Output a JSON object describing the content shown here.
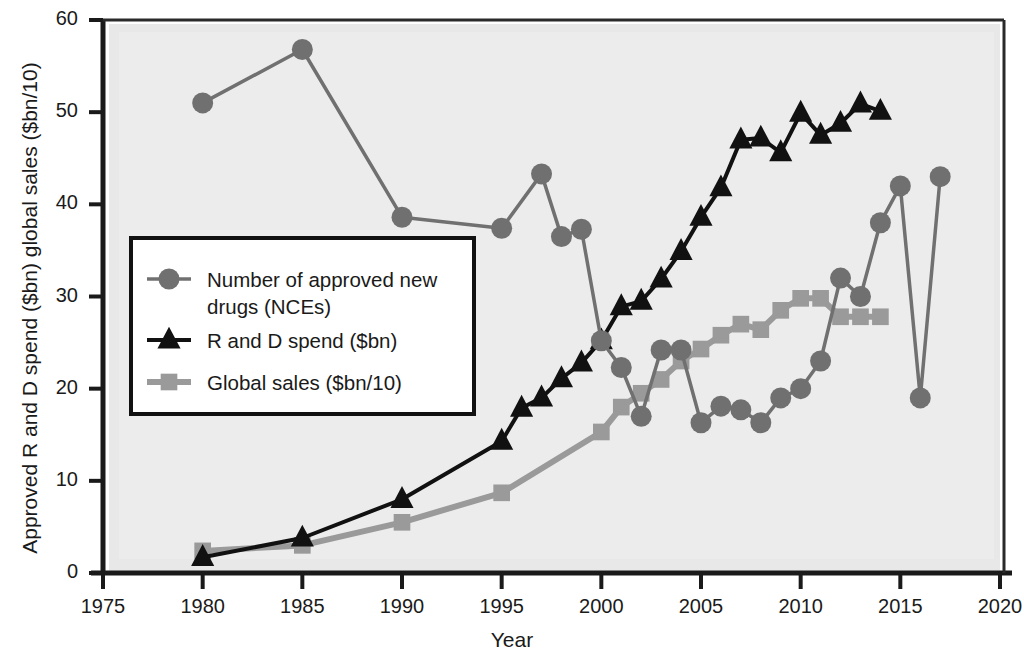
{
  "chart_data": {
    "type": "line",
    "title": "",
    "xlabel": "Year",
    "ylabel": "Approved R and D spend ($bn) global sales ($bn/10)",
    "xlim": [
      1975,
      2020
    ],
    "ylim": [
      0,
      60
    ],
    "xticks": [
      1975,
      1980,
      1985,
      1990,
      1995,
      2000,
      2005,
      2010,
      2015,
      2020
    ],
    "yticks": [
      0,
      10,
      20,
      30,
      40,
      50,
      60
    ],
    "grid": false,
    "legend_position": "center-left inside plot",
    "series": [
      {
        "name": "Number of approved new drugs (NCEs)",
        "marker": "circle",
        "color": "#707070",
        "x": [
          1980,
          1985,
          1990,
          1995,
          1997,
          1998,
          1999,
          2000,
          2001,
          2002,
          2003,
          2004,
          2005,
          2006,
          2007,
          2008,
          2009,
          2010,
          2011,
          2012,
          2013,
          2014,
          2015,
          2016,
          2017
        ],
        "y": [
          51,
          56.8,
          38.6,
          37.4,
          43.3,
          36.5,
          37.3,
          25.2,
          22.3,
          17,
          24.2,
          24.2,
          16.3,
          18.1,
          17.7,
          16.3,
          19,
          20,
          23,
          32,
          30,
          38,
          42,
          19,
          43
        ]
      },
      {
        "name": "R and D spend ($bn)",
        "marker": "triangle",
        "color": "#111111",
        "x": [
          1980,
          1985,
          1990,
          1995,
          1996,
          1997,
          1998,
          1999,
          2000,
          2001,
          2002,
          2003,
          2004,
          2005,
          2006,
          2007,
          2008,
          2009,
          2010,
          2011,
          2012,
          2013,
          2014
        ],
        "y": [
          1.7,
          3.8,
          8.0,
          14.3,
          17.9,
          19.0,
          21.1,
          22.8,
          25.2,
          28.9,
          29.5,
          31.9,
          34.9,
          38.6,
          41.8,
          47.0,
          47.2,
          45.6,
          49.9,
          47.5,
          48.8,
          50.9,
          50.1
        ]
      },
      {
        "name": "Global sales ($bn/10)",
        "marker": "square",
        "color": "#9a9a9a",
        "x": [
          1980,
          1985,
          1990,
          1995,
          2000,
          2001,
          2002,
          2003,
          2004,
          2005,
          2006,
          2007,
          2008,
          2009,
          2010,
          2011,
          2012,
          2013,
          2014
        ],
        "y": [
          2.4,
          3.0,
          5.5,
          8.7,
          15.3,
          18.0,
          19.5,
          21.0,
          23.0,
          24.3,
          25.8,
          27.0,
          26.4,
          28.5,
          29.8,
          29.8,
          27.8,
          27.8,
          27.8
        ]
      }
    ],
    "legend": [
      "Number of approved new drugs (NCEs)",
      "R and D spend ($bn)",
      "Global sales ($bn/10)"
    ],
    "legend_lines": [
      [
        "Number of approved new",
        "drugs (NCEs)"
      ],
      [
        "R and D spend ($bn)"
      ],
      [
        "Global sales ($bn/10)"
      ]
    ],
    "colors": {
      "nce": "#707070",
      "rd": "#111111",
      "sales": "#9a9a9a",
      "plot_background": "#e8e8e8",
      "axis": "#1a1a1a",
      "legend_background": "#ffffff"
    }
  }
}
